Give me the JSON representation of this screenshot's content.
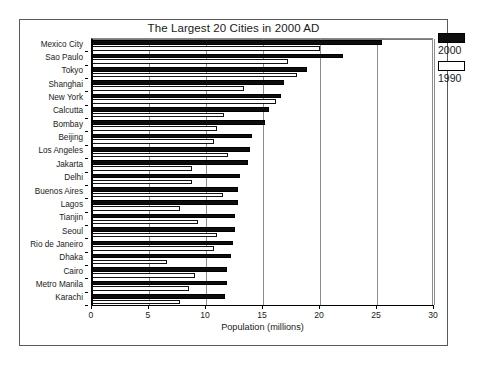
{
  "chart_data": {
    "type": "bar",
    "orientation": "horizontal",
    "title": "The Largest 20 Cities in 2000 AD",
    "xlabel": "Population (millions)",
    "ylabel": "",
    "xlim": [
      0,
      30
    ],
    "xticks": [
      0,
      5,
      10,
      15,
      20,
      25,
      30
    ],
    "xtick_labels": [
      "0",
      "5",
      "10",
      "15",
      "20",
      "25",
      "30"
    ],
    "grid": true,
    "legend_position": "right",
    "categories": [
      "Mexico City",
      "Sao Paulo",
      "Tokyo",
      "Shanghai",
      "New York",
      "Calcutta",
      "Bombay",
      "Beijing",
      "Los Angeles",
      "Jakarta",
      "Delhi",
      "Buenos Aires",
      "Lagos",
      "Tianjin",
      "Seoul",
      "Rio de Janeiro",
      "Dhaka",
      "Cairo",
      "Metro Manila",
      "Karachi"
    ],
    "series": [
      {
        "name": "2000",
        "color": "#0d0d0d",
        "values": [
          25.4,
          22.0,
          18.9,
          16.8,
          16.6,
          15.5,
          15.2,
          14.0,
          13.9,
          13.7,
          13.0,
          12.8,
          12.8,
          12.5,
          12.5,
          12.4,
          12.2,
          11.8,
          11.8,
          11.7
        ]
      },
      {
        "name": "1990",
        "color": "#ffffff",
        "values": [
          20.0,
          17.2,
          18.0,
          13.3,
          16.1,
          11.6,
          11.0,
          10.7,
          11.9,
          8.8,
          8.8,
          11.5,
          7.7,
          9.3,
          11.0,
          10.7,
          6.6,
          9.0,
          8.5,
          7.7
        ]
      }
    ]
  },
  "legend": {
    "entries": [
      {
        "label": "2000",
        "swatch": "filled-black"
      },
      {
        "label": "1990",
        "swatch": "empty-white"
      }
    ]
  }
}
